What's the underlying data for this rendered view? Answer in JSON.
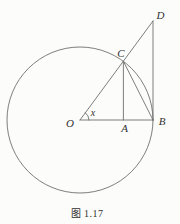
{
  "figure": {
    "caption": "图 1.17",
    "colors": {
      "background": "#fcfcfa",
      "line": "#6f6f6f",
      "label": "#303030"
    },
    "points": {
      "O": {
        "label": "O"
      },
      "A": {
        "label": "A"
      },
      "B": {
        "label": "B"
      },
      "C": {
        "label": "C"
      },
      "D": {
        "label": "D"
      }
    },
    "angle": {
      "label": "x"
    }
  }
}
